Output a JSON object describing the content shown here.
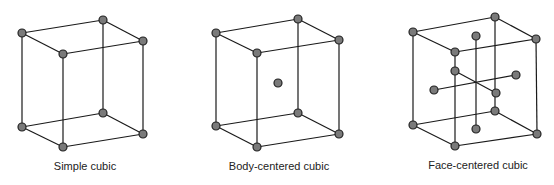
{
  "diagrams": [
    {
      "label": "Simple cubic",
      "label_pos": [
        85,
        161
      ],
      "corners": [
        [
          22,
          33
        ],
        [
          103,
          20
        ],
        [
          143,
          41
        ],
        [
          63,
          54
        ],
        [
          22,
          127
        ],
        [
          103,
          113
        ],
        [
          143,
          134
        ],
        [
          63,
          147
        ]
      ],
      "extra_atoms": [],
      "extra_lines": []
    },
    {
      "label": "Body-centered cubic",
      "label_pos": [
        279,
        161
      ],
      "corners": [
        [
          216,
          33
        ],
        [
          298,
          19
        ],
        [
          339,
          40
        ],
        [
          257,
          53
        ],
        [
          216,
          126
        ],
        [
          298,
          113
        ],
        [
          339,
          134
        ],
        [
          257,
          147
        ]
      ],
      "extra_atoms": [
        [
          278,
          83
        ]
      ],
      "extra_lines": []
    },
    {
      "label": "Face-centered cubic",
      "label_pos": [
        478,
        160
      ],
      "corners": [
        [
          413,
          32
        ],
        [
          495,
          17
        ],
        [
          536,
          39
        ],
        [
          455,
          52
        ],
        [
          413,
          125
        ],
        [
          495,
          111
        ],
        [
          537,
          134
        ],
        [
          455,
          146
        ]
      ],
      "extra_atoms": [
        [
          476,
          36
        ],
        [
          476,
          129
        ],
        [
          434,
          90
        ],
        [
          516,
          75
        ],
        [
          455,
          71
        ],
        [
          496,
          93
        ]
      ],
      "extra_lines": [
        [
          [
            476,
            36
          ],
          [
            476,
            129
          ]
        ],
        [
          [
            434,
            90
          ],
          [
            516,
            75
          ]
        ],
        [
          [
            455,
            71
          ],
          [
            496,
            93
          ]
        ]
      ]
    }
  ],
  "colors": {
    "line": "#1a1a1a",
    "atom_fill": "#7a7a7a",
    "atom_stroke": "#222222"
  }
}
